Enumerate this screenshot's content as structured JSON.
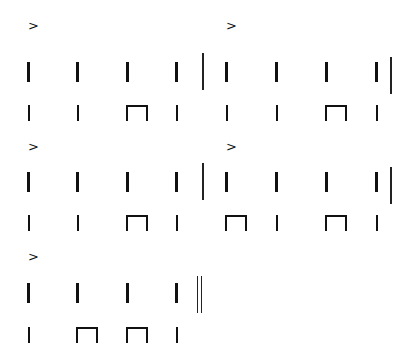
{
  "symbols": {
    "accent": ">",
    "quarter": "quarter-note-stem",
    "eighth_pair": "beamed-eighth-pair",
    "barline": "single-barline",
    "final_barline": "double-barline"
  },
  "systems": [
    {
      "measures": [
        {
          "accent_on_beat": 1,
          "upper": [
            "q",
            "q",
            "q",
            "q"
          ],
          "lower": [
            "q",
            "q",
            "ee",
            "q"
          ],
          "end": "bar"
        },
        {
          "accent_on_beat": 1,
          "upper": [
            "q",
            "q",
            "q",
            "q"
          ],
          "lower": [
            "q",
            "q",
            "ee",
            "q"
          ],
          "end": "bar"
        }
      ]
    },
    {
      "measures": [
        {
          "accent_on_beat": 1,
          "upper": [
            "q",
            "q",
            "q",
            "q"
          ],
          "lower": [
            "q",
            "q",
            "ee",
            "q"
          ],
          "end": "bar"
        },
        {
          "accent_on_beat": 1,
          "upper": [
            "q",
            "q",
            "q",
            "q"
          ],
          "lower": [
            "ee",
            "q",
            "ee",
            "q"
          ],
          "end": "bar"
        }
      ]
    },
    {
      "measures": [
        {
          "accent_on_beat": 1,
          "upper": [
            "q",
            "q",
            "q",
            "q"
          ],
          "lower": [
            "q",
            "ee",
            "ee",
            "q"
          ],
          "end": "final"
        }
      ]
    }
  ],
  "colors": {
    "ink": "#111111",
    "background": "#ffffff"
  }
}
